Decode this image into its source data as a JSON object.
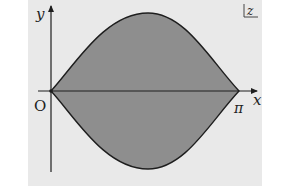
{
  "diagram": {
    "type": "complex-plane-region",
    "colors": {
      "panel_background": "#e9e9e9",
      "region_fill": "#8e8e8e",
      "stroke": "#1e1e1e",
      "text": "#222222"
    },
    "labels": {
      "y_axis": "y",
      "x_axis": "x",
      "origin": "O",
      "pi": "π",
      "plane": "z"
    },
    "region": {
      "description": "Lens-shaped region symmetric about the real axis between 0 and π",
      "left_vertex": "O",
      "right_vertex": "π"
    }
  }
}
